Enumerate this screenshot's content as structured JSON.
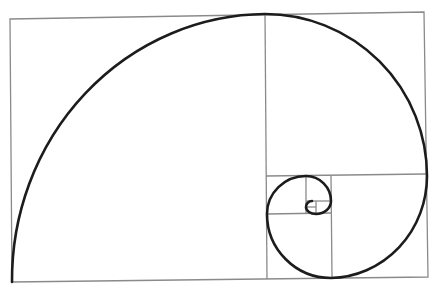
{
  "diagram": {
    "type": "golden-spiral",
    "colors": {
      "background": "#ffffff",
      "grid_stroke": "#8a8a8a",
      "spiral_stroke": "#1c1c1c"
    },
    "outer_rectangle": {
      "corners": [
        [
          10,
          19
        ],
        [
          424,
          12
        ],
        [
          428,
          277
        ],
        [
          12,
          282
        ]
      ]
    },
    "squares": [
      {
        "id": "sq-1",
        "x": 11,
        "y": 15,
        "size": 254
      },
      {
        "id": "sq-2",
        "x": 265,
        "y": 14,
        "size": 162
      },
      {
        "id": "sq-3",
        "x": 331,
        "y": 176,
        "size": 97
      },
      {
        "id": "sq-4",
        "x": 267,
        "y": 214,
        "size": 64
      },
      {
        "id": "sq-5",
        "x": 267,
        "y": 176,
        "size": 39
      },
      {
        "id": "sq-6",
        "x": 306,
        "y": 176,
        "size": 25
      },
      {
        "id": "sq-7",
        "x": 316,
        "y": 201,
        "size": 15
      },
      {
        "id": "sq-8",
        "x": 306,
        "y": 201,
        "size": 10
      }
    ],
    "labels": []
  }
}
